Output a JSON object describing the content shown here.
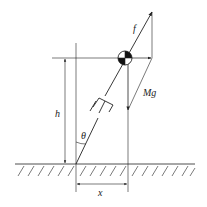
{
  "diagram": {
    "labels": {
      "force": "f",
      "weight": "Mg",
      "height": "h",
      "angle": "θ",
      "horizontal_offset": "x"
    },
    "colors": {
      "stroke": "#222222",
      "background": "#ffffff"
    }
  }
}
